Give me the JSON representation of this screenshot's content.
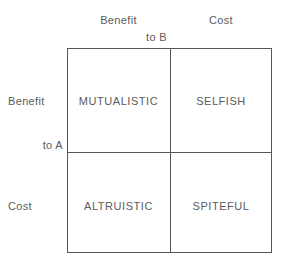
{
  "diagram": {
    "type": "2x2-matrix",
    "axes": {
      "column_axis_label": "to B",
      "row_axis_label": "to A"
    },
    "column_headers": [
      {
        "label": "Benefit"
      },
      {
        "label": "Cost"
      }
    ],
    "row_headers": [
      {
        "label": "Benefit"
      },
      {
        "label": "Cost"
      }
    ],
    "cells": [
      {
        "position": "top-left",
        "label": "MUTUALISTIC"
      },
      {
        "position": "top-right",
        "label": "SELFISH"
      },
      {
        "position": "bottom-left",
        "label": "ALTRUISTIC"
      },
      {
        "position": "bottom-right",
        "label": "SPITEFUL"
      }
    ],
    "colors": {
      "line": "#57585a",
      "text": "#5a5b5d",
      "background": "#ffffff"
    }
  }
}
